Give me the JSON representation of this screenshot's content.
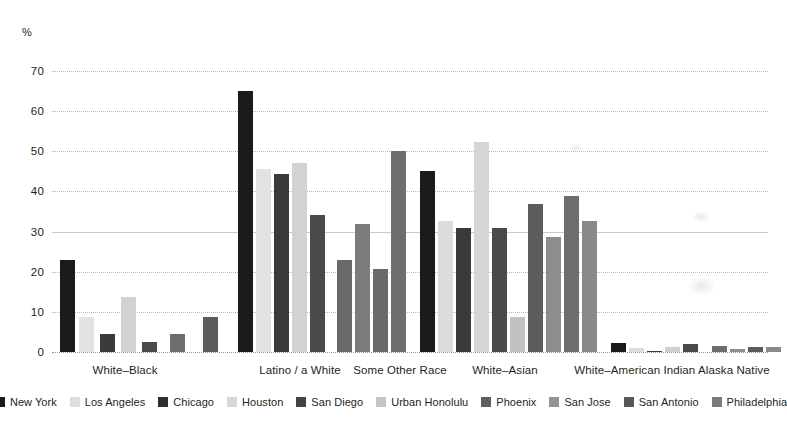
{
  "chart_data": {
    "type": "bar",
    "title": "",
    "subtitle": "",
    "xlabel": "",
    "ylabel": "%",
    "ylim": [
      0,
      70
    ],
    "yticks": [
      0,
      10,
      20,
      30,
      40,
      50,
      60,
      70
    ],
    "grid": true,
    "legend_position": "bottom",
    "categories": [
      "White–Black",
      "Latino / a White",
      "Some Other Race",
      "White–Asian",
      "White–American Indian Alaska Native"
    ],
    "series": [
      {
        "name": "New York",
        "color": "#1a1a1a",
        "values": [
          22.8,
          65.0,
          null,
          45.2,
          2.3
        ]
      },
      {
        "name": "Los Angeles",
        "color": "#e2e2e2",
        "values": [
          8.8,
          45.6,
          null,
          32.6,
          1.0
        ]
      },
      {
        "name": "Chicago",
        "color": "#3a3a3a",
        "values": [
          4.5,
          44.3,
          null,
          31.0,
          0.3
        ]
      },
      {
        "name": "Houston",
        "color": "#d2d2d2",
        "values": [
          13.6,
          47.2,
          null,
          52.2,
          1.2
        ]
      },
      {
        "name": "San Diego",
        "color": "#4a4a4a",
        "values": [
          2.6,
          34.2,
          null,
          31.0,
          2.0
        ]
      },
      {
        "name": "Urban Honolulu",
        "color": "#c6c6c6",
        "values": [
          null,
          null,
          22.8,
          8.6,
          null
        ]
      },
      {
        "name": "Phoenix",
        "color": "#6e6e6e",
        "values": [
          4.4,
          null,
          32.0,
          36.8,
          1.5
        ]
      },
      {
        "name": "San Jose",
        "color": "#8d8d8d",
        "values": [
          null,
          null,
          20.8,
          28.6,
          0.8
        ]
      },
      {
        "name": "San Antonio",
        "color": "#5c5c5c",
        "values": [
          8.6,
          null,
          50.0,
          38.8,
          1.3
        ]
      },
      {
        "name": "Philadelphia",
        "color": "#777777",
        "values": [
          null,
          null,
          null,
          32.6,
          1.2
        ]
      }
    ],
    "bars": [
      {
        "group": 0,
        "series": "New York",
        "value": 22.8,
        "x": 60,
        "w": 15,
        "color": "#1a1a1a"
      },
      {
        "group": 0,
        "series": "Los Angeles",
        "value": 8.8,
        "x": 79,
        "w": 15,
        "color": "#e2e2e2"
      },
      {
        "group": 0,
        "series": "Chicago",
        "value": 4.5,
        "x": 100,
        "w": 15,
        "color": "#3a3a3a"
      },
      {
        "group": 0,
        "series": "Houston",
        "value": 13.6,
        "x": 121,
        "w": 15,
        "color": "#d2d2d2"
      },
      {
        "group": 0,
        "series": "San Diego",
        "value": 2.6,
        "x": 142,
        "w": 15,
        "color": "#4a4a4a"
      },
      {
        "group": 0,
        "series": "Phoenix",
        "value": 4.4,
        "x": 170,
        "w": 15,
        "color": "#6e6e6e"
      },
      {
        "group": 0,
        "series": "San Antonio",
        "value": 8.6,
        "x": 203,
        "w": 15,
        "color": "#5c5c5c"
      },
      {
        "group": 1,
        "series": "New York",
        "value": 65.0,
        "x": 238,
        "w": 15,
        "color": "#1a1a1a"
      },
      {
        "group": 1,
        "series": "Los Angeles",
        "value": 45.6,
        "x": 256,
        "w": 15,
        "color": "#e2e2e2"
      },
      {
        "group": 1,
        "series": "Chicago",
        "value": 44.3,
        "x": 274,
        "w": 15,
        "color": "#3a3a3a"
      },
      {
        "group": 1,
        "series": "Houston",
        "value": 47.2,
        "x": 292,
        "w": 15,
        "color": "#d2d2d2"
      },
      {
        "group": 1,
        "series": "San Diego",
        "value": 34.2,
        "x": 310,
        "w": 15,
        "color": "#4a4a4a"
      },
      {
        "group": 2,
        "series": "Urban Honolulu",
        "value": 22.8,
        "x": 337,
        "w": 15,
        "color": "#6a6a6a"
      },
      {
        "group": 2,
        "series": "Phoenix",
        "value": 32.0,
        "x": 355,
        "w": 15,
        "color": "#7c7c7c"
      },
      {
        "group": 2,
        "series": "San Jose",
        "value": 20.8,
        "x": 373,
        "w": 15,
        "color": "#6a6a6a"
      },
      {
        "group": 2,
        "series": "San Antonio",
        "value": 50.0,
        "x": 391,
        "w": 15,
        "color": "#6e6e6e"
      },
      {
        "group": 3,
        "series": "New York",
        "value": 45.2,
        "x": 420,
        "w": 15,
        "color": "#1a1a1a"
      },
      {
        "group": 3,
        "series": "Los Angeles",
        "value": 32.6,
        "x": 438,
        "w": 15,
        "color": "#dcdcdc"
      },
      {
        "group": 3,
        "series": "Chicago",
        "value": 31.0,
        "x": 456,
        "w": 15,
        "color": "#3a3a3a"
      },
      {
        "group": 3,
        "series": "Houston",
        "value": 52.2,
        "x": 474,
        "w": 15,
        "color": "#d6d6d6"
      },
      {
        "group": 3,
        "series": "San Diego",
        "value": 31.0,
        "x": 492,
        "w": 15,
        "color": "#4a4a4a"
      },
      {
        "group": 3,
        "series": "Urban Honolulu",
        "value": 8.6,
        "x": 510,
        "w": 15,
        "color": "#c2c2c2"
      },
      {
        "group": 3,
        "series": "Phoenix",
        "value": 36.8,
        "x": 528,
        "w": 15,
        "color": "#5c5c5c"
      },
      {
        "group": 3,
        "series": "San Jose",
        "value": 28.6,
        "x": 546,
        "w": 15,
        "color": "#8d8d8d"
      },
      {
        "group": 3,
        "series": "San Antonio",
        "value": 38.8,
        "x": 564,
        "w": 15,
        "color": "#6e6e6e"
      },
      {
        "group": 3,
        "series": "Philadelphia",
        "value": 32.6,
        "x": 582,
        "w": 15,
        "color": "#8a8a8a"
      },
      {
        "group": 4,
        "series": "New York",
        "value": 2.3,
        "x": 611,
        "w": 15,
        "color": "#1a1a1a"
      },
      {
        "group": 4,
        "series": "Los Angeles",
        "value": 1.0,
        "x": 629,
        "w": 15,
        "color": "#dcdcdc"
      },
      {
        "group": 4,
        "series": "Chicago",
        "value": 0.3,
        "x": 647,
        "w": 15,
        "color": "#3a3a3a"
      },
      {
        "group": 4,
        "series": "Houston",
        "value": 1.2,
        "x": 665,
        "w": 15,
        "color": "#cfcfcf"
      },
      {
        "group": 4,
        "series": "San Diego",
        "value": 2.0,
        "x": 683,
        "w": 15,
        "color": "#4a4a4a"
      },
      {
        "group": 4,
        "series": "Phoenix",
        "value": 1.5,
        "x": 712,
        "w": 15,
        "color": "#6e6e6e"
      },
      {
        "group": 4,
        "series": "San Jose",
        "value": 0.8,
        "x": 730,
        "w": 15,
        "color": "#8d8d8d"
      },
      {
        "group": 4,
        "series": "San Antonio",
        "value": 1.3,
        "x": 748,
        "w": 15,
        "color": "#5c5c5c"
      },
      {
        "group": 4,
        "series": "Philadelphia",
        "value": 1.2,
        "x": 766,
        "w": 15,
        "color": "#8a8a8a"
      }
    ],
    "group_label_positions": [
      125,
      300,
      400,
      505,
      672
    ]
  },
  "legend": {
    "items": [
      {
        "label": "New York",
        "color": "#1a1a1a"
      },
      {
        "label": "Los Angeles",
        "color": "#dedede"
      },
      {
        "label": "Chicago",
        "color": "#2e2e2e"
      },
      {
        "label": "Houston",
        "color": "#d8d8d8"
      },
      {
        "label": "San Diego",
        "color": "#434343"
      },
      {
        "label": "Urban Honolulu",
        "color": "#c4c4c4"
      },
      {
        "label": "Phoenix",
        "color": "#5f5f5f"
      },
      {
        "label": "San Jose",
        "color": "#949494"
      },
      {
        "label": "San Antonio",
        "color": "#585858"
      },
      {
        "label": "Philadelphia",
        "color": "#7b7b7b"
      }
    ]
  }
}
